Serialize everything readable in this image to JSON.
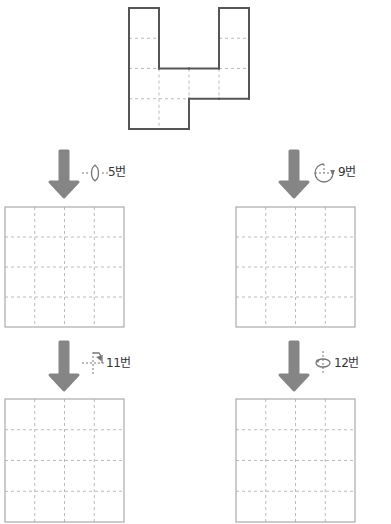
{
  "colors": {
    "outline": "#555555",
    "grid_dash": "#bbbbbb",
    "answer_border": "#aaaaaa",
    "arrow": "#858585",
    "icon": "#777777"
  },
  "source_shape": {
    "grid_size": 4,
    "filled_cells": [
      [
        0,
        0
      ],
      [
        0,
        3
      ],
      [
        1,
        0
      ],
      [
        1,
        3
      ],
      [
        2,
        0
      ],
      [
        2,
        1
      ],
      [
        2,
        2
      ],
      [
        2,
        3
      ],
      [
        3,
        0
      ],
      [
        3,
        1
      ]
    ]
  },
  "steps": [
    {
      "id": "step-5",
      "label": "5번",
      "icon": "flip-vertical-axis-icon",
      "answer_grid_size": 4
    },
    {
      "id": "step-9",
      "label": "9번",
      "icon": "rotate-quarter-icon",
      "answer_grid_size": 4
    },
    {
      "id": "step-11",
      "label": "11번",
      "icon": "flip-diagonal-icon",
      "answer_grid_size": 4
    },
    {
      "id": "step-12",
      "label": "12번",
      "icon": "flip-horizontal-axis-icon",
      "answer_grid_size": 4
    }
  ]
}
